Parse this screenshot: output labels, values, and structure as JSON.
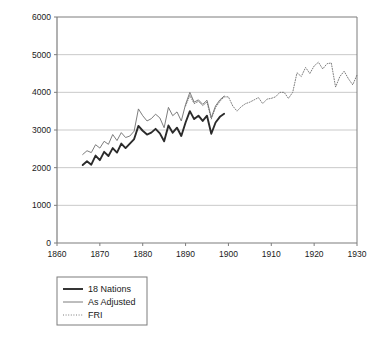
{
  "chart_data": {
    "type": "line",
    "title": "",
    "subtitle": "",
    "xlabel": "",
    "ylabel": "Kilometers",
    "xlim": [
      1860,
      1930
    ],
    "ylim": [
      0,
      6000
    ],
    "xticks": [
      1860,
      1870,
      1880,
      1890,
      1900,
      1910,
      1920,
      1930
    ],
    "yticks": [
      0,
      1000,
      2000,
      3000,
      4000,
      5000,
      6000
    ],
    "grid": "horizontal",
    "legend_position": "below-left",
    "series": [
      {
        "name": "18 Nations",
        "style": "solid-thick",
        "color": "#2b2b2b",
        "x": [
          1866,
          1867,
          1868,
          1869,
          1870,
          1871,
          1872,
          1873,
          1874,
          1875,
          1876,
          1877,
          1878,
          1879,
          1880,
          1881,
          1882,
          1883,
          1884,
          1885,
          1886,
          1887,
          1888,
          1889,
          1890,
          1891,
          1892,
          1893,
          1894,
          1895,
          1896,
          1897,
          1898,
          1899
        ],
        "values": [
          2070,
          2170,
          2080,
          2320,
          2200,
          2420,
          2310,
          2520,
          2400,
          2640,
          2520,
          2640,
          2760,
          3110,
          2980,
          2880,
          2930,
          3030,
          2910,
          2700,
          3120,
          2930,
          3060,
          2840,
          3200,
          3500,
          3290,
          3380,
          3240,
          3380,
          2900,
          3200,
          3350,
          3430
        ]
      },
      {
        "name": "As Adjusted",
        "style": "solid-thin",
        "color": "#6e6e6e",
        "x": [
          1866,
          1867,
          1868,
          1869,
          1870,
          1871,
          1872,
          1873,
          1874,
          1875,
          1876,
          1877,
          1878,
          1879,
          1880,
          1881,
          1882,
          1883,
          1884,
          1885,
          1886,
          1887,
          1888,
          1889,
          1890,
          1891,
          1892,
          1893,
          1894,
          1895,
          1896,
          1897,
          1898,
          1899
        ],
        "values": [
          2350,
          2450,
          2400,
          2610,
          2520,
          2700,
          2620,
          2880,
          2720,
          2930,
          2800,
          2840,
          2970,
          3560,
          3380,
          3240,
          3300,
          3420,
          3320,
          3060,
          3600,
          3380,
          3480,
          3240,
          3680,
          4000,
          3740,
          3800,
          3680,
          3790,
          3330,
          3640,
          3800,
          3900
        ]
      },
      {
        "name": "FRI",
        "style": "dotted",
        "color": "#6e6e6e",
        "x": [
          1890,
          1891,
          1892,
          1893,
          1894,
          1895,
          1896,
          1897,
          1898,
          1899,
          1900,
          1901,
          1902,
          1903,
          1904,
          1905,
          1906,
          1907,
          1908,
          1909,
          1910,
          1911,
          1912,
          1913,
          1914,
          1915,
          1916,
          1917,
          1918,
          1919,
          1920,
          1921,
          1922,
          1923,
          1924,
          1925,
          1926,
          1927,
          1928,
          1929,
          1930
        ],
        "values": [
          3640,
          3920,
          3700,
          3760,
          3650,
          3740,
          3290,
          3600,
          3760,
          3880,
          3880,
          3640,
          3500,
          3620,
          3700,
          3740,
          3800,
          3860,
          3700,
          3820,
          3840,
          3880,
          4000,
          4000,
          3840,
          4000,
          4520,
          4420,
          4660,
          4500,
          4700,
          4800,
          4620,
          4760,
          4780,
          4140,
          4420,
          4560,
          4360,
          4200,
          4460
        ]
      }
    ]
  },
  "legend": {
    "items": [
      {
        "label": "18 Nations",
        "swatch": "solid-thick"
      },
      {
        "label": "As Adjusted",
        "swatch": "solid-thin"
      },
      {
        "label": "FRI",
        "swatch": "dotted"
      }
    ]
  },
  "colors": {
    "series_18_nations": "#2b2b2b",
    "series_as_adjusted": "#6e6e6e",
    "series_fri": "#6e6e6e",
    "grid": "#c9c9c9",
    "axis": "#7d7d7d",
    "text": "#1a1a1a",
    "background": "#ffffff"
  }
}
